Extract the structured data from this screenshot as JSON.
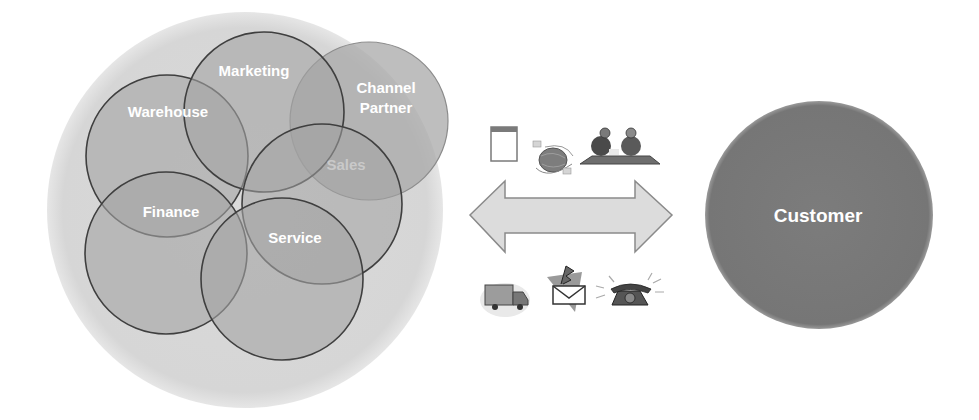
{
  "organization": {
    "departments": [
      {
        "id": "marketing",
        "label": "Marketing"
      },
      {
        "id": "warehouse",
        "label": "Warehouse"
      },
      {
        "id": "channel-partner",
        "label_line1": "Channel",
        "label_line2": "Partner"
      },
      {
        "id": "sales",
        "label": "Sales"
      },
      {
        "id": "finance",
        "label": "Finance"
      },
      {
        "id": "service",
        "label": "Service"
      }
    ]
  },
  "customer": {
    "label": "Customer"
  },
  "channels": {
    "top_icons": [
      "document-icon",
      "globe-icon",
      "meeting-icon"
    ],
    "bottom_icons": [
      "delivery-truck-icon",
      "email-icon",
      "telephone-icon"
    ]
  },
  "colors": {
    "background_circle": "#d9d9d9",
    "department_fill": "#9a9a9a",
    "department_stroke": "#3f3f3f",
    "customer_fill": "#7b7b7b",
    "arrow_fill": "#dcdcdc",
    "arrow_stroke": "#8a8a8a",
    "sales_label": "#c9c9c9"
  }
}
